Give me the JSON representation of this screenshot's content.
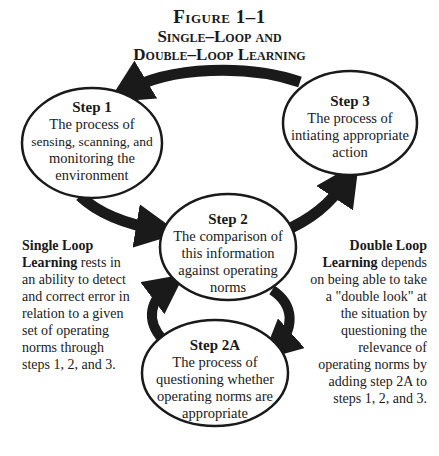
{
  "figure": {
    "label": "Figure 1–1",
    "title_line1": "Single–Loop and",
    "title_line2": "Double–Loop Learning"
  },
  "nodes": [
    {
      "id": "step1",
      "step": "Step 1",
      "lines": [
        "The process of",
        "sensing, scanning, and",
        "monitoring the",
        "environment"
      ]
    },
    {
      "id": "step3",
      "step": "Step 3",
      "lines": [
        "The process of",
        "intiating appropriate",
        "action"
      ]
    },
    {
      "id": "step2",
      "step": "Step 2",
      "lines": [
        "The comparison of",
        "this information",
        "against operating",
        "norms"
      ]
    },
    {
      "id": "step2a",
      "step": "Step 2A",
      "lines": [
        "The process of",
        "questioning whether",
        "operating norms are",
        "appropriate"
      ]
    }
  ],
  "arrows": [
    {
      "from": "Step 3",
      "to": "Step 1"
    },
    {
      "from": "Step 1",
      "to": "Step 2"
    },
    {
      "from": "Step 2",
      "to": "Step 3"
    },
    {
      "from": "Step 2",
      "to": "Step 2A"
    },
    {
      "from": "Step 2A",
      "to": "Step 2"
    }
  ],
  "single_loop": {
    "term_line1": "Single Loop",
    "term_line2": "Learning",
    "rest_line2": " rests in",
    "lines": [
      "an ability to detect",
      "and correct error in",
      "relation to a given",
      "set of operating",
      "norms through",
      "steps 1, 2, and 3."
    ]
  },
  "double_loop": {
    "term_line1": "Double Loop",
    "term_line2": "Learning",
    "rest_line2": " depends",
    "lines": [
      "on being able to take",
      "a \"double look\" at",
      "the situation by",
      "questioning the",
      "relevance of",
      "operating norms by",
      "adding step 2A to",
      "steps 1, 2, and 3."
    ]
  },
  "colors": {
    "ink": "#1a1a1a",
    "background": "#ffffff"
  }
}
